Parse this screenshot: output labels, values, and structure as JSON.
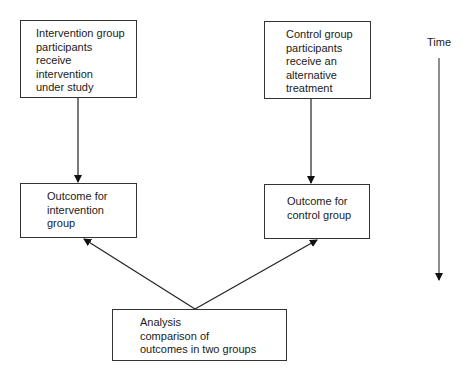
{
  "diagram": {
    "boxes": {
      "intervention_group": {
        "label": "Intervention group\nparticipants\nreceive\nintervention\nunder study"
      },
      "control_group": {
        "label": "Control group\nparticipants\nreceive an\nalternative\ntreatment"
      },
      "outcome_intervention": {
        "label": "Outcome for\nintervention\ngroup"
      },
      "outcome_control": {
        "label": "Outcome for\ncontrol group"
      },
      "analysis": {
        "label": "Analysis\ncomparison of\noutcomes in two groups"
      }
    },
    "time_axis": {
      "label": "Time",
      "direction": "down"
    },
    "edges": [
      {
        "from": "intervention_group",
        "to": "outcome_intervention"
      },
      {
        "from": "control_group",
        "to": "outcome_control"
      },
      {
        "from": "analysis",
        "to": "outcome_intervention"
      },
      {
        "from": "analysis",
        "to": "outcome_control"
      }
    ],
    "colors": {
      "line": "#1a1a1a",
      "border": "#333333",
      "background": "#ffffff"
    }
  }
}
